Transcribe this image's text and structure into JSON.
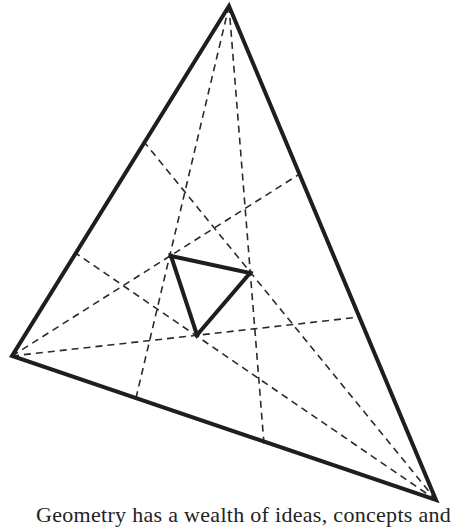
{
  "figure": {
    "outer_triangle": {
      "vertices": {
        "A": [
          229,
          6
        ],
        "B": [
          12,
          356
        ],
        "C": [
          436,
          500
        ]
      }
    },
    "trisectors": [
      {
        "from": "A",
        "to": [
          136,
          398
        ]
      },
      {
        "from": "A",
        "to": [
          264,
          444
        ]
      },
      {
        "from": "B",
        "to": [
          298,
          175
        ]
      },
      {
        "from": "B",
        "to": [
          360,
          317
        ]
      },
      {
        "from": "C",
        "to": [
          145,
          143
        ]
      },
      {
        "from": "C",
        "to": [
          77,
          254
        ]
      }
    ],
    "inner_triangle": {
      "vertices": [
        [
          171,
          256
        ],
        [
          250,
          273
        ],
        [
          197,
          335
        ]
      ]
    },
    "colors": {
      "stroke": "#1e1e1e",
      "dash": "#2a2a2a",
      "background": "#ffffff"
    }
  },
  "caption": {
    "text": "Geometry has a wealth of ideas, concepts and"
  }
}
